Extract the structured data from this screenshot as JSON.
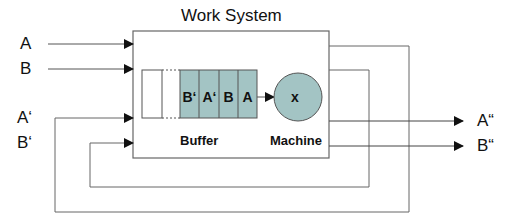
{
  "title": "Work System",
  "inputs": [
    {
      "label": "A",
      "y": 44
    },
    {
      "label": "B",
      "y": 69
    },
    {
      "label": "A‘",
      "y": 118
    },
    {
      "label": "B‘",
      "y": 143
    }
  ],
  "outputs": [
    {
      "label": "A“",
      "y": 121
    },
    {
      "label": "B“",
      "y": 146
    }
  ],
  "buffer": {
    "label": "Buffer",
    "cells": [
      "B‘",
      "A‘",
      "B",
      "A"
    ]
  },
  "machine": {
    "label": "Machine",
    "symbol": "x"
  },
  "colors": {
    "fill": "#a3c4c4",
    "line": "#555555"
  }
}
